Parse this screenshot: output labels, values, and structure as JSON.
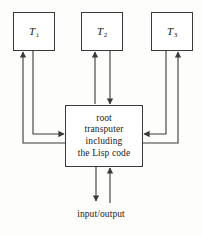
{
  "diagram": {
    "background_color": "#fdfdfb",
    "line_color": "#3a3a3a",
    "nodes": {
      "leaf1": {
        "label": "T",
        "subscript": "1",
        "full_label": "T1"
      },
      "leaf2": {
        "label": "T",
        "subscript": "2",
        "full_label": "T2"
      },
      "leaf3": {
        "label": "T",
        "subscript": "3",
        "full_label": "T3"
      },
      "root": {
        "line1": "root",
        "line2": "transputer",
        "line3": "including",
        "line4": "the Lisp code",
        "text": "root\ntransputer\nincluding\nthe Lisp code"
      }
    },
    "io": {
      "label": "input/output"
    }
  }
}
